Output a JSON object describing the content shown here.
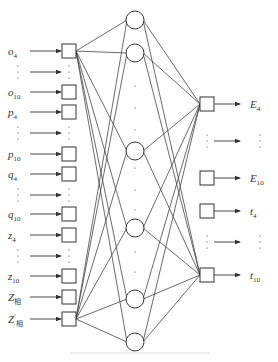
{
  "diagram": {
    "type": "neural-network",
    "colors": {
      "stroke": "#333333",
      "line": "#444444",
      "text": "#333333",
      "caption": "#dddddd"
    },
    "input_layer": {
      "box_x": 62,
      "box_size": 14,
      "arrow_from_x": 30,
      "label_x": 8,
      "nodes": [
        {
          "id": "o4",
          "base": "o",
          "sub": "4",
          "prime": false,
          "y": 51,
          "kind": "node"
        },
        {
          "id": "dots1",
          "kind": "ellipsis",
          "y": 72
        },
        {
          "id": "o10",
          "base": "o",
          "sub": "10",
          "prime": false,
          "y": 92,
          "kind": "node"
        },
        {
          "id": "p4",
          "base": "p",
          "sub": "4",
          "prime": false,
          "y": 112,
          "kind": "node"
        },
        {
          "id": "dots2",
          "kind": "ellipsis",
          "y": 133
        },
        {
          "id": "p10",
          "base": "p",
          "sub": "10",
          "prime": false,
          "y": 154,
          "kind": "node"
        },
        {
          "id": "q4",
          "base": "q",
          "sub": "4",
          "prime": false,
          "y": 174,
          "kind": "node"
        },
        {
          "id": "dots3",
          "kind": "ellipsis",
          "y": 195
        },
        {
          "id": "q10",
          "base": "q",
          "sub": "10",
          "prime": false,
          "y": 214,
          "kind": "node"
        },
        {
          "id": "z4",
          "base": "z",
          "sub": "4",
          "prime": false,
          "y": 235,
          "kind": "node"
        },
        {
          "id": "dots4",
          "kind": "ellipsis",
          "y": 256
        },
        {
          "id": "z10",
          "base": "z",
          "sub": "10",
          "prime": false,
          "y": 276,
          "kind": "node"
        },
        {
          "id": "Zxiang",
          "base": "Z",
          "sub": "相",
          "prime": false,
          "y": 297,
          "kind": "node"
        },
        {
          "id": "Zxiang2",
          "base": "Z",
          "sub": "相",
          "prime": true,
          "y": 319,
          "kind": "node"
        }
      ]
    },
    "hidden_layer": {
      "cx": 135,
      "r": 9,
      "nodes": [
        {
          "id": "h1",
          "y": 20
        },
        {
          "id": "h2",
          "y": 53
        },
        {
          "id": "h3",
          "y": 151
        },
        {
          "id": "h4",
          "y": 228
        },
        {
          "id": "h5",
          "y": 299
        },
        {
          "id": "h6",
          "y": 342
        }
      ],
      "ellipses": [
        [
          86,
          108,
          130
        ],
        [
          168,
          190,
          210
        ],
        [
          252,
          272
        ]
      ]
    },
    "output_layer": {
      "box_x": 200,
      "box_size": 14,
      "arrow_to_x": 240,
      "label_x": 250,
      "nodes": [
        {
          "id": "E4",
          "base": "E",
          "sub": "4",
          "y": 104,
          "kind": "node"
        },
        {
          "id": "dots5",
          "kind": "ellipsis",
          "y": 141
        },
        {
          "id": "E10",
          "base": "E",
          "sub": "10",
          "y": 178,
          "kind": "node"
        },
        {
          "id": "t4",
          "base": "t",
          "sub": "4",
          "y": 211,
          "kind": "node"
        },
        {
          "id": "dots6",
          "kind": "ellipsis",
          "y": 242
        },
        {
          "id": "t10",
          "base": "t",
          "sub": "10",
          "y": 275,
          "kind": "node"
        }
      ]
    },
    "connections": {
      "input_to_hidden": [
        [
          "o4",
          "all"
        ],
        [
          "Zxiang2",
          "all"
        ]
      ],
      "hidden_to_output": [
        [
          "E4",
          "all"
        ],
        [
          "t10",
          "all"
        ]
      ],
      "note": "Drawn edges fan from the first and last input boxes to every hidden node, and from every hidden node to the first (E4) and last (t10) output boxes."
    },
    "caption": {
      "text": "",
      "legible": false
    }
  }
}
